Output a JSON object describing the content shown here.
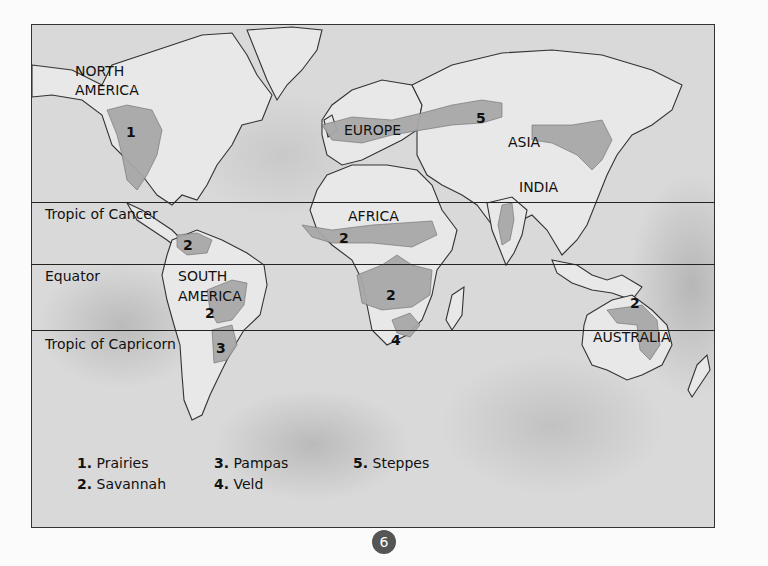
{
  "map": {
    "latitude_lines": [
      {
        "label": "Tropic of Cancer",
        "y": 202
      },
      {
        "label": "Equator",
        "y": 264
      },
      {
        "label": "Tropic of Capricorn",
        "y": 330
      }
    ],
    "continent_labels": {
      "north_america_1": "NORTH",
      "north_america_2": "AMERICA",
      "south_america_1": "SOUTH",
      "south_america_2": "AMERICA",
      "europe": "EUROPE",
      "asia": "ASIA",
      "india": "INDIA",
      "africa": "AFRICA",
      "australia": "AUSTRALIA"
    },
    "region_markers": {
      "prairies_na": "1",
      "savannah_ca": "2",
      "savannah_sa": "2",
      "pampas_sa": "3",
      "savannah_wafrica": "2",
      "savannah_cafrica": "2",
      "veld_safrica": "4",
      "steppes_asia": "5",
      "savannah_australia": "2"
    }
  },
  "legend": {
    "items": [
      {
        "num": "1.",
        "label": "Prairies"
      },
      {
        "num": "2.",
        "label": "Savannah"
      },
      {
        "num": "3.",
        "label": "Pampas"
      },
      {
        "num": "4.",
        "label": "Veld"
      },
      {
        "num": "5.",
        "label": "Steppes"
      }
    ]
  },
  "page_number": "6",
  "colors": {
    "ocean": "#d9d9d9",
    "land": "#e8e8e8",
    "grassland": "#a8a8a8",
    "page_badge": "#555555"
  }
}
